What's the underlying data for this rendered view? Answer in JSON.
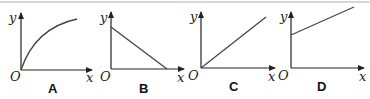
{
  "figure": {
    "axis_labels": {
      "x": "x",
      "y": "y",
      "origin": "O"
    },
    "colors": {
      "line": "#333333",
      "axis": "#222222",
      "border": "#d8d8d8"
    },
    "options": [
      {
        "label": "A",
        "shape": "concave-down curve through origin, increasing and leveling off"
      },
      {
        "label": "B",
        "shape": "straight line decreasing from positive y-intercept to x-axis"
      },
      {
        "label": "C",
        "shape": "straight line through origin with positive slope"
      },
      {
        "label": "D",
        "shape": "straight line with positive y-intercept and positive slope"
      }
    ]
  }
}
